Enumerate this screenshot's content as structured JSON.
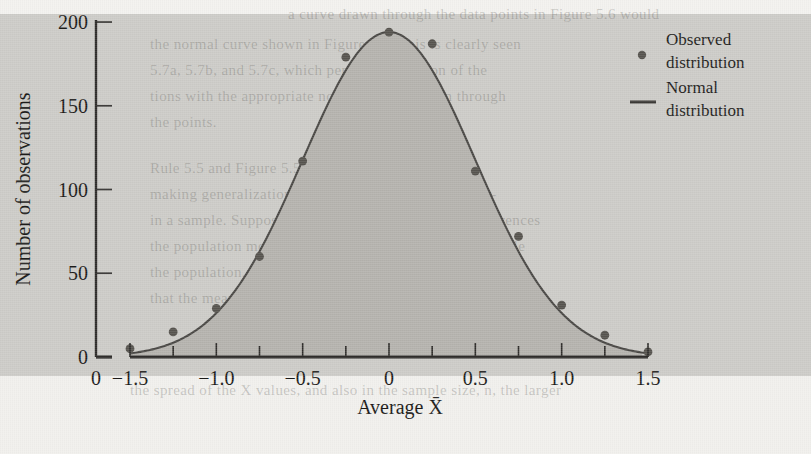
{
  "chart_data": {
    "type": "line",
    "title": "",
    "subtitle": "",
    "xlabel": "Average X̄",
    "ylabel": "Number of observations",
    "xlim": [
      -1.5,
      1.5
    ],
    "ylim": [
      0,
      200
    ],
    "xticks": [
      -1.5,
      -1.0,
      -0.5,
      0,
      0.5,
      1.0,
      1.5
    ],
    "xticklabels": [
      "−1.5",
      "−1.0",
      "−0.5",
      "0",
      "0.5",
      "1.0",
      "1.5"
    ],
    "xtick_minor": [
      -1.25,
      -0.75,
      -0.25,
      0.25,
      0.75,
      1.25
    ],
    "xaxis_break_label": "0",
    "yticks": [
      0,
      50,
      100,
      150,
      200
    ],
    "yticklabels": [
      "0",
      "50",
      "100",
      "150",
      "200"
    ],
    "grid": false,
    "legend_position": "top-right",
    "series": [
      {
        "name": "Observed distribution",
        "marker": "dot",
        "x": [
          -1.5,
          -1.25,
          -1.0,
          -0.75,
          -0.5,
          -0.25,
          0,
          0.25,
          0.5,
          0.75,
          1.0,
          1.25,
          1.5
        ],
        "values": [
          5,
          15,
          29,
          60,
          117,
          179,
          194,
          187,
          111,
          72,
          31,
          13,
          3
        ]
      },
      {
        "name": "Normal distribution",
        "marker": "line",
        "peak_value": 194,
        "mean": 0,
        "sigma": 0.5,
        "x": [
          -1.5,
          -1.4,
          -1.3,
          -1.2,
          -1.1,
          -1.0,
          -0.9,
          -0.8,
          -0.7,
          -0.6,
          -0.5,
          -0.4,
          -0.3,
          -0.2,
          -0.1,
          0,
          0.1,
          0.2,
          0.3,
          0.4,
          0.5,
          0.6,
          0.7,
          0.8,
          0.9,
          1.0,
          1.1,
          1.2,
          1.3,
          1.4,
          1.5
        ],
        "values": [
          2.6,
          4.5,
          7.4,
          11.8,
          18.0,
          26.3,
          36.8,
          49.3,
          63.6,
          78.9,
          94.4,
          109.0,
          121.7,
          131.5,
          137.7,
          194,
          137.7,
          131.5,
          121.7,
          109.0,
          94.4,
          78.9,
          63.6,
          49.3,
          36.8,
          26.3,
          18.0,
          11.8,
          7.4,
          4.5,
          2.6
        ]
      }
    ]
  },
  "legend": {
    "entries": [
      {
        "label_line1": "Observed",
        "label_line2": "distribution",
        "marker": "dot-marker"
      },
      {
        "label_line1": "Normal",
        "label_line2": "distribution",
        "marker": "line-marker"
      }
    ]
  },
  "colors": {
    "curve": "#4a4845",
    "marker": "#57544f",
    "fill_under": "#b5b3ae",
    "plot_background": "#cdccc8",
    "axis": "#2e2c2a",
    "text": "#1c1b19"
  },
  "background_text": {
    "lines": [
      "a curve drawn through the data points in Figure 5.6 would",
      "the normal curve shown in Figure 5.5. This is clearly seen",
      "5.7a, 5.7b, and 5.7c, which permit comparison of the",
      "tions with the appropriate normal curves drawn through",
      "the points.",
      "Rule 5.5 and Figure 5.5 suggest another important",
      "making generalizations about a population from infor-",
      "in a sample. Suppose you are interested in making inferences",
      "the population mean and you have drawn a random sample",
      "the population. We know that the mean of the sample is",
      "that the mean is normally distributed. We also know, by Rule",
      "the spread of the X values, and also in the sample size, n, the larger"
    ]
  }
}
